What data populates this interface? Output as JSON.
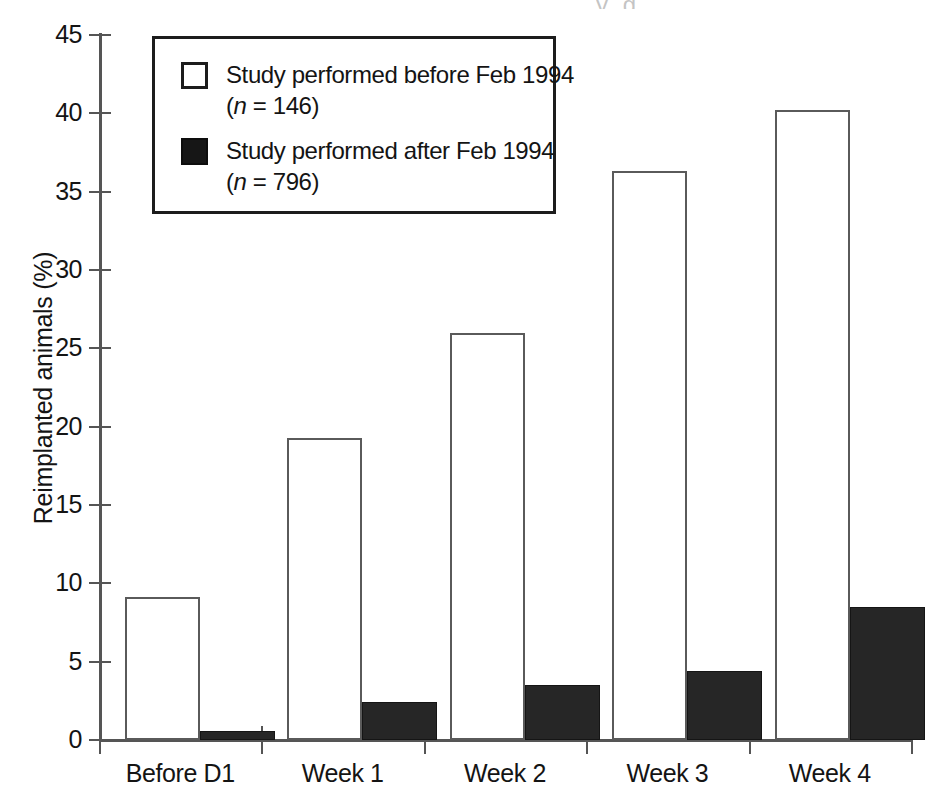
{
  "chart_data": {
    "type": "bar",
    "title": "",
    "subtitle": "",
    "xlabel": "",
    "ylabel": "Reimplanted animals (%)",
    "categories": [
      "Before D1",
      "Week 1",
      "Week 2",
      "Week 3",
      "Week 4"
    ],
    "series": [
      {
        "name": "Study performed before Feb 1994",
        "n": 146,
        "style": "open",
        "color": "#ffffff",
        "edge_color": "#5a5a5a",
        "values": [
          9.1,
          19.3,
          26.0,
          36.3,
          40.2
        ]
      },
      {
        "name": "Study performed after Feb 1994",
        "n": 796,
        "style": "filled",
        "color": "#262626",
        "edge_color": "#151515",
        "values": [
          0.6,
          2.4,
          3.5,
          4.4,
          8.5
        ]
      }
    ],
    "ylim": [
      0,
      45
    ],
    "yticks": [
      0,
      5,
      10,
      15,
      20,
      25,
      30,
      35,
      40,
      45
    ],
    "ytick_labels": [
      "0",
      "5",
      "10",
      "15",
      "20",
      "25",
      "30",
      "35",
      "40",
      "45"
    ],
    "grid": false,
    "legend_position": "upper-left-inside"
  },
  "legend": {
    "entries": [
      {
        "swatch": "open-square-swatch",
        "line1": "Study performed before Feb 1994",
        "n_prefix": "(",
        "n_symbol": "n",
        "n_equals": " = 146)"
      },
      {
        "swatch": "filled-square-swatch",
        "line1": "Study performed after Feb 1994",
        "n_prefix": "(",
        "n_symbol": "n",
        "n_equals": " = 796)"
      }
    ]
  },
  "axes": {
    "y_title": "Reimplanted animals (%)",
    "y_tick_labels": [
      "45",
      "40",
      "35",
      "30",
      "25",
      "20",
      "15",
      "10",
      "5",
      "0"
    ],
    "x_tick_labels": [
      "Before D1",
      "Week 1",
      "Week 2",
      "Week 3",
      "Week 4"
    ]
  },
  "artifacts": {
    "top_clipped_text": "y g"
  }
}
